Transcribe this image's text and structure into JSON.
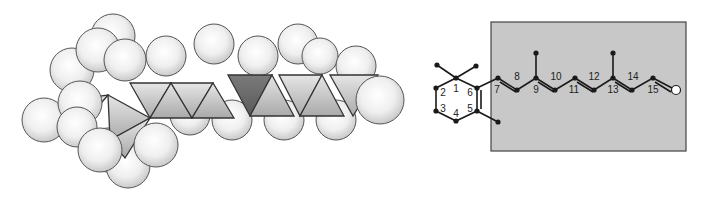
{
  "figure": {
    "left_panel": {
      "kind": "space-filling model",
      "highlighted_face_color": "#6a6a6a",
      "face_color": "#d9d9d9",
      "atom_fill": "#f2f2f2",
      "outline_color": "#555555"
    },
    "right_panel": {
      "kind": "skeletal structure",
      "box_color": "#c8c8c8",
      "box_border": "#444444",
      "bond_color": "#1a1a1a",
      "ring_labels": [
        "1",
        "2",
        "3",
        "4",
        "5",
        "6"
      ],
      "chain_labels": [
        "7",
        "8",
        "9",
        "10",
        "11",
        "12",
        "13",
        "14",
        "15"
      ],
      "terminal_atom": "O"
    }
  }
}
